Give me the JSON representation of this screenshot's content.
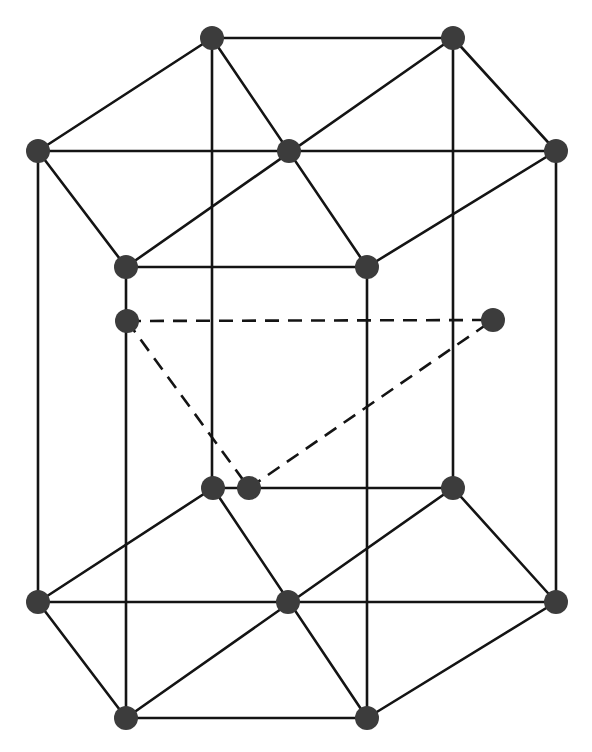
{
  "diagram": {
    "colors": {
      "background": "#ffffff",
      "line": "#141414",
      "atom": "#3c3c3c"
    },
    "atom_radius": 12,
    "layers": {
      "top": [
        [
          212,
          38
        ],
        [
          453,
          38
        ],
        [
          38,
          151
        ],
        [
          289,
          151
        ],
        [
          556,
          151
        ],
        [
          126,
          267
        ],
        [
          367,
          267
        ]
      ],
      "middle": [
        [
          127,
          321
        ],
        [
          493,
          320
        ],
        [
          249,
          488
        ]
      ],
      "bottom": [
        [
          213,
          488
        ],
        [
          453,
          488
        ],
        [
          38,
          602
        ],
        [
          288,
          602
        ],
        [
          556,
          602
        ],
        [
          126,
          718
        ],
        [
          367,
          718
        ]
      ]
    },
    "edges_solid": [
      [
        [
          212,
          38
        ],
        [
          453,
          38
        ]
      ],
      [
        [
          453,
          38
        ],
        [
          556,
          151
        ]
      ],
      [
        [
          556,
          151
        ],
        [
          367,
          267
        ]
      ],
      [
        [
          367,
          267
        ],
        [
          126,
          267
        ]
      ],
      [
        [
          126,
          267
        ],
        [
          38,
          151
        ]
      ],
      [
        [
          38,
          151
        ],
        [
          212,
          38
        ]
      ],
      [
        [
          38,
          151
        ],
        [
          556,
          151
        ]
      ],
      [
        [
          212,
          38
        ],
        [
          367,
          267
        ]
      ],
      [
        [
          453,
          38
        ],
        [
          126,
          267
        ]
      ],
      [
        [
          213,
          488
        ],
        [
          453,
          488
        ]
      ],
      [
        [
          453,
          488
        ],
        [
          556,
          602
        ]
      ],
      [
        [
          556,
          602
        ],
        [
          367,
          718
        ]
      ],
      [
        [
          367,
          718
        ],
        [
          126,
          718
        ]
      ],
      [
        [
          126,
          718
        ],
        [
          38,
          602
        ]
      ],
      [
        [
          38,
          602
        ],
        [
          213,
          488
        ]
      ],
      [
        [
          38,
          602
        ],
        [
          556,
          602
        ]
      ],
      [
        [
          213,
          488
        ],
        [
          367,
          718
        ]
      ],
      [
        [
          453,
          488
        ],
        [
          126,
          718
        ]
      ],
      [
        [
          38,
          151
        ],
        [
          38,
          602
        ]
      ],
      [
        [
          556,
          151
        ],
        [
          556,
          602
        ]
      ],
      [
        [
          126,
          267
        ],
        [
          126,
          718
        ]
      ],
      [
        [
          367,
          267
        ],
        [
          367,
          718
        ]
      ],
      [
        [
          212,
          38
        ],
        [
          212,
          488
        ]
      ],
      [
        [
          453,
          38
        ],
        [
          453,
          488
        ]
      ]
    ],
    "edges_dashed": [
      [
        [
          127,
          321
        ],
        [
          493,
          320
        ]
      ],
      [
        [
          127,
          321
        ],
        [
          249,
          488
        ]
      ],
      [
        [
          249,
          488
        ],
        [
          493,
          320
        ]
      ]
    ]
  }
}
